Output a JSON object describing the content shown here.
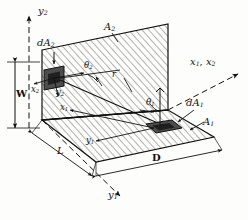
{
  "figure": {
    "type": "radiation-view-factor-diagram",
    "background_color": "#fdfdfb",
    "line_color": "#111111",
    "hatch_color": "#3a3a3a",
    "element_fill": "#4a4a4a"
  },
  "axes": [
    {
      "id": "y2",
      "label": "y",
      "sub": "2",
      "direction": "up",
      "style": "dashed-with-arrow"
    },
    {
      "id": "x1x2",
      "label": "x",
      "sub": "1",
      "label2": "x",
      "sub2": "2",
      "text": "x1, x2",
      "direction": "right",
      "style": "dashed-with-arrow"
    },
    {
      "id": "y1",
      "label": "y",
      "sub": "1",
      "direction": "down-right",
      "style": "dashed-with-arrow"
    }
  ],
  "surfaces": [
    {
      "id": "A2",
      "label": "A",
      "sub": "2",
      "orientation": "vertical",
      "hatched": true
    },
    {
      "id": "A1",
      "label": "A",
      "sub": "1",
      "orientation": "horizontal",
      "hatched": true
    }
  ],
  "elements": [
    {
      "id": "dA2",
      "label": "dA",
      "sub": "2",
      "on_surface": "A2",
      "shaded": true
    },
    {
      "id": "dA1",
      "label": "dA",
      "sub": "1",
      "on_surface": "A1",
      "shaded": true
    }
  ],
  "angles": [
    {
      "id": "theta2",
      "label": "θ",
      "sub": "2",
      "at": "dA2"
    },
    {
      "id": "theta1",
      "label": "θ",
      "sub": "1",
      "at": "dA1"
    }
  ],
  "ray": {
    "id": "r",
    "label": "r",
    "from": "dA2",
    "to": "dA1"
  },
  "local_coords": [
    {
      "id": "x2",
      "label": "x",
      "sub": "2"
    },
    {
      "id": "y2_local",
      "label": "y",
      "sub": "2"
    },
    {
      "id": "x1",
      "label": "x",
      "sub": "1"
    },
    {
      "id": "y1_local",
      "label": "y",
      "sub": "1"
    }
  ],
  "dimensions": [
    {
      "id": "W",
      "label": "W",
      "measures": "height of vertical surface A2"
    },
    {
      "id": "L",
      "label": "L",
      "measures": "common edge length"
    },
    {
      "id": "D",
      "label": "D",
      "measures": "depth of horizontal surface A1"
    }
  ]
}
